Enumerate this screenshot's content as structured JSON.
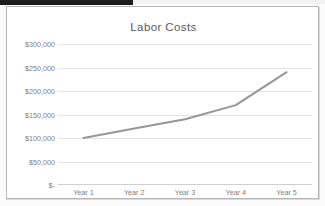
{
  "window": {
    "background_color": "#fbfbfb",
    "frame_border_color": "#b6b6b6"
  },
  "chart_data": {
    "type": "line",
    "title": "Labor Costs",
    "xlabel": "",
    "ylabel": "",
    "categories": [
      "Year 1",
      "Year 2",
      "Year 3",
      "Year 4",
      "Year 5"
    ],
    "values": [
      100000,
      120000,
      140000,
      170000,
      240000
    ],
    "series": [
      {
        "name": "Labor Costs",
        "values": [
          100000,
          120000,
          140000,
          170000,
          240000
        ],
        "color": "#969696"
      }
    ],
    "ylim": [
      0,
      300000
    ],
    "ytick_values": [
      0,
      50000,
      100000,
      150000,
      200000,
      250000,
      300000
    ],
    "ytick_labels": [
      "$-",
      "$50,000",
      "$100,000",
      "$150,000",
      "$200,000",
      "$250,000",
      "$300,000"
    ],
    "grid": true,
    "grid_color": "#e2e2e2",
    "legend": false,
    "legend_position": "none",
    "line_color": "#969696",
    "line_width": 2,
    "markers": false,
    "plot_background": "#ffffff"
  },
  "axis": {
    "y_labels": [
      "$300,000",
      "$250,000",
      "$200,000",
      "$150,000",
      "$100,000",
      "$50,000",
      "$-"
    ],
    "x_labels": [
      "Year 1",
      "Year 2",
      "Year 3",
      "Year 4",
      "Year 5"
    ]
  }
}
